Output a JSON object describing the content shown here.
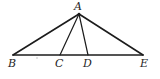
{
  "figure": {
    "kind": "geometry-diagram",
    "background_color": "#ffffff",
    "stroke_color": "#1c1c1c",
    "label_color": "#252525",
    "width": 160,
    "height": 79,
    "points": {
      "A": {
        "label": "A",
        "x": 79,
        "y": 14
      },
      "B": {
        "label": "B",
        "x": 13,
        "y": 55
      },
      "C": {
        "label": "C",
        "x": 60,
        "y": 55
      },
      "D": {
        "label": "D",
        "x": 88,
        "y": 55
      },
      "E": {
        "label": "E",
        "x": 143,
        "y": 55
      }
    },
    "segments": [
      {
        "name": "AB",
        "from": "A",
        "to": "B",
        "width": 1.6
      },
      {
        "name": "AE",
        "from": "A",
        "to": "E",
        "width": 1.6
      },
      {
        "name": "BE",
        "from": "B",
        "to": "E",
        "width": 1.6
      },
      {
        "name": "AC",
        "from": "A",
        "to": "C",
        "width": 1.2
      },
      {
        "name": "AD",
        "from": "A",
        "to": "D",
        "width": 1.2
      }
    ],
    "speck": {
      "x": 36,
      "y": 57
    }
  }
}
